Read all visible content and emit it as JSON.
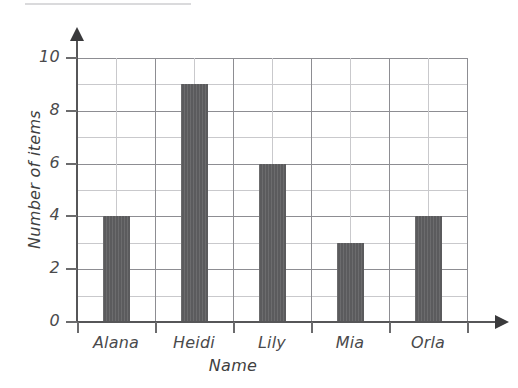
{
  "chart_data": {
    "type": "bar",
    "title": "",
    "xlabel": "Name",
    "ylabel": "Number of items",
    "categories": [
      "Alana",
      "Heidi",
      "Lily",
      "Mia",
      "Orla"
    ],
    "values": [
      4,
      9,
      6,
      3,
      4
    ],
    "ylim": [
      0,
      10
    ],
    "ytick_labels": [
      "0",
      "2",
      "4",
      "6",
      "8",
      "10"
    ],
    "ytick_values": [
      0,
      2,
      4,
      6,
      8,
      10
    ],
    "y_minor_step": 1,
    "grid": "both",
    "legend": "none",
    "bar_color": "#5b5b5d",
    "grid_color": "#c9c9cc",
    "axis_color": "#565658"
  },
  "figure": {
    "background": "#ffffff",
    "scan_artifact": "top-edge-line"
  }
}
